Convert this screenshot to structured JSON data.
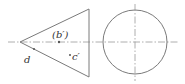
{
  "diagram": {
    "type": "orthographic-projection",
    "views": [
      {
        "name": "front-view",
        "shape": "triangle",
        "vertices": [
          [
            20,
            42
          ],
          [
            89,
            9
          ],
          [
            89,
            77
          ]
        ],
        "centerline_y": 42
      },
      {
        "name": "side-view",
        "shape": "circle",
        "center": [
          135,
          42
        ],
        "radius": 32
      }
    ],
    "labels": {
      "b_prime": "(b′)",
      "c_prime": "c′",
      "d": "d"
    },
    "colors": {
      "outline": "#7a7a7a",
      "centerline": "#9a9a9a",
      "text": "#333333",
      "point": "#555555"
    }
  }
}
